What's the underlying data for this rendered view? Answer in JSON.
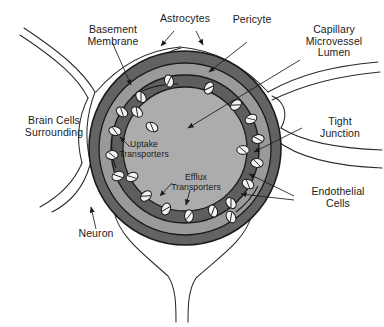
{
  "diagram": {
    "labels": {
      "basement_membrane": "Basement\nMembrane",
      "astrocytes": "Astrocytes",
      "pericyte": "Pericyte",
      "capillary_lumen": "Capillary\nMicrovessel\nLumen",
      "brain_cells": "Brain Cells\nSurrounding",
      "tight_junction": "Tight\nJunction",
      "endothelial_cells": "Endothelial\nCells",
      "uptake_transporters": "Uptake\nTransporters",
      "efflux_transporters": "Efflux\nTransporters",
      "neuron": "Neuron"
    },
    "colors": {
      "background": "#ffffff",
      "outline": "#1a1a1a",
      "astrocyte_sheath": "#636363",
      "basement_membrane": "#9a9a9a",
      "endothelial_ring": "#5e5e5e",
      "lumen": "#acacac",
      "transporter_fill": "#f2f2f2",
      "text": "#1a1a1a"
    },
    "structure": {
      "center_x": 185,
      "center_y": 148,
      "rings": [
        {
          "name": "astrocyte-sheath",
          "outer_r": 96,
          "fill": "#636363"
        },
        {
          "name": "basement-membrane",
          "outer_r": 86,
          "fill": "#9a9a9a"
        },
        {
          "name": "endothelial-ring",
          "outer_r": 74,
          "fill": "#5e5e5e"
        },
        {
          "name": "capillary-lumen",
          "outer_r": 62,
          "fill": "#acacac"
        }
      ],
      "transporter_count": 22
    }
  }
}
